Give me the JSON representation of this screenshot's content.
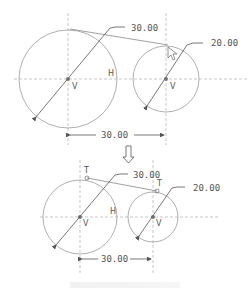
{
  "figure": {
    "top_diagram": {
      "large_circle": {
        "diameter_label": "30.00",
        "center_label": "V",
        "side_label": "H"
      },
      "small_circle": {
        "diameter_label": "20.00",
        "center_label": "V"
      },
      "center_distance_label": "30.00",
      "cursor": "pointer-arrow-icon"
    },
    "transition_arrow": "down-arrow-icon",
    "bottom_diagram": {
      "large_circle": {
        "diameter_label": "30.00",
        "center_label": "V",
        "side_label": "H",
        "tangent_point_label": "T"
      },
      "small_circle": {
        "diameter_label": "20.00",
        "center_label": "V",
        "tangent_point_label": "T"
      },
      "center_distance_label": "30.00"
    }
  }
}
